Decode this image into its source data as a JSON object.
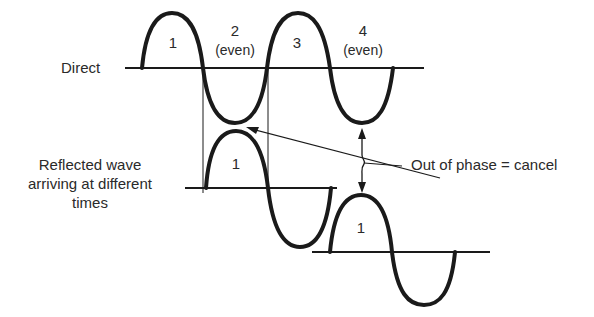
{
  "diagram": {
    "title": "",
    "colors": {
      "ink": "#1a1a1a",
      "text": "#2a2a2a",
      "background": "#ffffff"
    },
    "direct": {
      "label": "Direct",
      "segments": [
        {
          "number": "1",
          "note": ""
        },
        {
          "number": "2",
          "note": "(even)"
        },
        {
          "number": "3",
          "note": ""
        },
        {
          "number": "4",
          "note": "(even)"
        }
      ]
    },
    "reflected": {
      "label_lines": [
        "Reflected wave",
        "arriving at different",
        "times"
      ],
      "waves": [
        {
          "segment_label": "1"
        },
        {
          "segment_label": "1"
        }
      ]
    },
    "annotation": {
      "text": "Out of phase = cancel"
    }
  }
}
